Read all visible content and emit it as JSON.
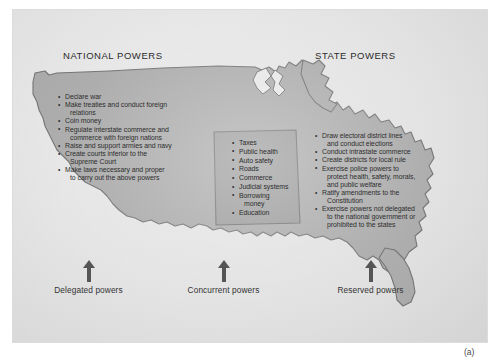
{
  "figure": {
    "caption": "(a)",
    "accent_color": "#a9a9a9",
    "overlap_color": "#9a9a9a",
    "outline_color": "#6f6f6f",
    "panel_color": "#e6e6e6"
  },
  "headings": {
    "national": "NATIONAL POWERS",
    "state": "STATE POWERS"
  },
  "national_powers": [
    {
      "text": "Declare war",
      "cont": false
    },
    {
      "text": "Make treaties and conduct foreign",
      "cont": false
    },
    {
      "text": "relations",
      "cont": true
    },
    {
      "text": "Coin money",
      "cont": false
    },
    {
      "text": "Regulate interstate commerce and",
      "cont": false
    },
    {
      "text": "commerce with foreign nations",
      "cont": true
    },
    {
      "text": "Raise and support armies and navy",
      "cont": false
    },
    {
      "text": "Create courts inferior to the",
      "cont": false
    },
    {
      "text": "Supreme Court",
      "cont": true
    },
    {
      "text": "Make laws necessary and proper",
      "cont": false
    },
    {
      "text": "to carry out the above powers",
      "cont": true
    }
  ],
  "concurrent_powers": [
    {
      "text": "Taxes",
      "cont": false
    },
    {
      "text": "Public health",
      "cont": false
    },
    {
      "text": "Auto safety",
      "cont": false
    },
    {
      "text": "Roads",
      "cont": false
    },
    {
      "text": "Commerce",
      "cont": false
    },
    {
      "text": "Judicial systems",
      "cont": false
    },
    {
      "text": "Borrowing",
      "cont": false
    },
    {
      "text": "money",
      "cont": true
    },
    {
      "text": "Education",
      "cont": false
    }
  ],
  "state_powers": [
    {
      "text": "Draw electoral district lines",
      "cont": false
    },
    {
      "text": "and conduct  elections",
      "cont": true
    },
    {
      "text": "Conduct intrastate commerce",
      "cont": false
    },
    {
      "text": "Create districts for local rule",
      "cont": false
    },
    {
      "text": "Exercise police powers to",
      "cont": false
    },
    {
      "text": "protect health, safety, morals,",
      "cont": true
    },
    {
      "text": "and public welfare",
      "cont": true
    },
    {
      "text": "Ratify amendments to the",
      "cont": false
    },
    {
      "text": "Constitution",
      "cont": true
    },
    {
      "text": "Exercise powers not delegated",
      "cont": false
    },
    {
      "text": "to the national government or",
      "cont": true
    },
    {
      "text": "prohibited to the states",
      "cont": true
    }
  ],
  "arrows": [
    {
      "id": "delegated",
      "label": "Delegated powers"
    },
    {
      "id": "concurrent",
      "label": "Concurrent powers"
    },
    {
      "id": "reserved",
      "label": "Reserved powers"
    }
  ]
}
